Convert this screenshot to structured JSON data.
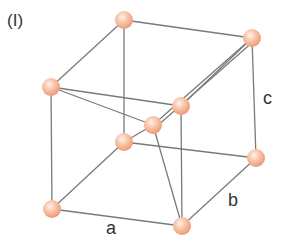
{
  "panel_label": "(I)",
  "axis_labels": {
    "a": "a",
    "b": "b",
    "c": "c"
  },
  "colors": {
    "edge": "#7a7a7a",
    "atom_light": "#fde3d6",
    "atom_mid": "#f7b99a",
    "atom_dark": "#ef9a78"
  },
  "atoms": [
    {
      "name": "top-back-left",
      "x": 124,
      "y": 20
    },
    {
      "name": "top-back-right",
      "x": 252,
      "y": 38
    },
    {
      "name": "top-front-left",
      "x": 51,
      "y": 87
    },
    {
      "name": "top-front-right",
      "x": 181,
      "y": 106
    },
    {
      "name": "body-center",
      "x": 153,
      "y": 125
    },
    {
      "name": "bottom-back-left",
      "x": 124,
      "y": 142
    },
    {
      "name": "bottom-back-right",
      "x": 256,
      "y": 158
    },
    {
      "name": "bottom-front-left",
      "x": 52,
      "y": 209
    },
    {
      "name": "bottom-front-right",
      "x": 182,
      "y": 226
    }
  ]
}
